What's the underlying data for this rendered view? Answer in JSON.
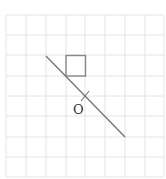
{
  "diagram": {
    "type": "grid-geometry",
    "grid": {
      "cols": 8,
      "rows": 8,
      "x0": 6,
      "y0": 15,
      "cell": 19.8,
      "color": "#e4e4e4"
    },
    "square": {
      "col": 3,
      "row": 2,
      "size": 1,
      "color": "#888888"
    },
    "line": {
      "x1": 46,
      "y1": 56,
      "x2": 125,
      "y2": 137,
      "color": "#777777"
    },
    "point": {
      "label": "O",
      "x": 85,
      "y": 96
    },
    "colors": {
      "grid": "#e4e4e4",
      "shape": "#888888",
      "line": "#777777"
    }
  }
}
